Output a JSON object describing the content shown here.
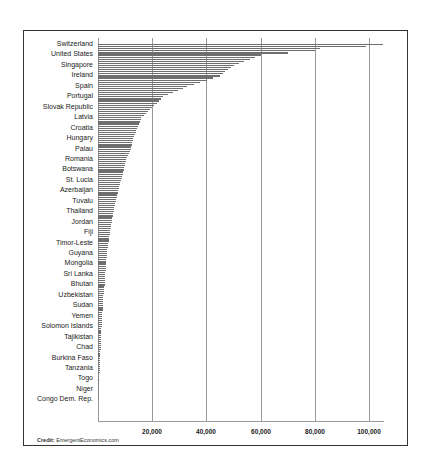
{
  "chart_data": {
    "type": "bar",
    "orientation": "horizontal",
    "title": "",
    "xlabel": "",
    "ylabel": "",
    "xlim": [
      0,
      107000
    ],
    "x_ticks": [
      "20,000",
      "40,000",
      "60,000",
      "80,000",
      "100,000"
    ],
    "x_tick_values": [
      20000,
      40000,
      60000,
      80000,
      100000
    ],
    "grid": "vertical",
    "legend": null,
    "note": "Bars sorted descending; only every ~5th country is labeled. Values estimated from gridlines.",
    "categories": [
      "Switzerland",
      "United States",
      "Singapore",
      "Ireland",
      "Spain",
      "Portugal",
      "Slovak Republic",
      "Latvia",
      "Croatia",
      "Hungary",
      "Palau",
      "Romania",
      "Botswana",
      "St. Lucia",
      "Azerbaijan",
      "Tuvalu",
      "Thailand",
      "Jordan",
      "Fiji",
      "Timor-Leste",
      "Guyana",
      "Mongolia",
      "Sri Lanka",
      "Bhutan",
      "Uzbekistan",
      "Sudan",
      "Yemen",
      "Solomon Islands",
      "Tajikistan",
      "Chad",
      "Burkina Faso",
      "Tanzania",
      "Togo",
      "Niger",
      "Congo Dem. Rep."
    ],
    "values": [
      105000,
      60000,
      50000,
      45000,
      33000,
      24000,
      20000,
      16000,
      14500,
      13000,
      12000,
      10500,
      9500,
      8500,
      7500,
      6500,
      5800,
      5000,
      4500,
      3800,
      3300,
      3000,
      2700,
      2400,
      2000,
      1800,
      1500,
      1300,
      1100,
      1000,
      700,
      600,
      500,
      400,
      250
    ],
    "top_bars_unlabeled": [
      99000,
      82000,
      80000
    ]
  },
  "credit": {
    "label": "Credit:",
    "source": "EmergentEconomics.com"
  }
}
